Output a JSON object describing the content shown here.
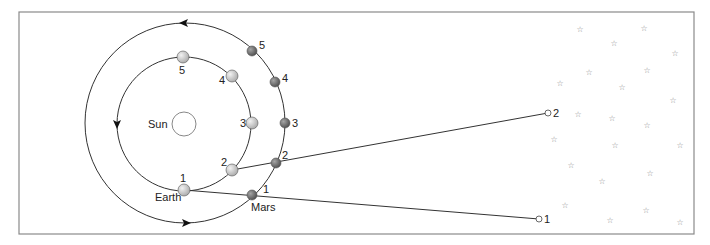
{
  "colors": {
    "frame": "#8a8a8a",
    "line": "#333333",
    "earth_fill": "#c9c9c9",
    "mars_fill": "#6e6e6e",
    "sun_fill": "#ffffff",
    "star": "#8a8a8a"
  },
  "frame": {
    "x": 19,
    "y": 12,
    "w": 675,
    "h": 222
  },
  "sun": {
    "label": "Sun",
    "cx": 184,
    "cy": 124,
    "r": 12,
    "label_x": 148,
    "label_y": 128
  },
  "orbits": {
    "earth": {
      "cx": 184,
      "cy": 124,
      "r": 67
    },
    "mars": {
      "cx": 185,
      "cy": 123,
      "r": 100
    }
  },
  "direction_arrows": [
    {
      "name": "outer-top-arrow",
      "x": 184,
      "y": 23,
      "dir": "left"
    },
    {
      "name": "outer-bottom-arrow",
      "x": 186,
      "y": 223,
      "dir": "right"
    },
    {
      "name": "inner-left-arrow",
      "x": 117,
      "y": 124,
      "dir": "down"
    }
  ],
  "earth_positions": [
    {
      "n": "1",
      "x": 184,
      "y": 190,
      "lx": 180,
      "ly": 182
    },
    {
      "n": "2",
      "x": 232,
      "y": 170,
      "lx": 221,
      "ly": 166
    },
    {
      "n": "3",
      "x": 252,
      "y": 123,
      "lx": 240,
      "ly": 127
    },
    {
      "n": "4",
      "x": 232,
      "y": 76,
      "lx": 219,
      "ly": 84
    },
    {
      "n": "5",
      "x": 183,
      "y": 57,
      "lx": 179,
      "ly": 74
    }
  ],
  "mars_positions": [
    {
      "n": "1",
      "x": 252,
      "y": 195,
      "lx": 263,
      "ly": 193
    },
    {
      "n": "2",
      "x": 276,
      "y": 163,
      "lx": 282,
      "ly": 159
    },
    {
      "n": "3",
      "x": 285,
      "y": 123,
      "lx": 292,
      "ly": 127
    },
    {
      "n": "4",
      "x": 275,
      "y": 82,
      "lx": 282,
      "ly": 82
    },
    {
      "n": "5",
      "x": 252,
      "y": 51,
      "lx": 259,
      "ly": 49
    }
  ],
  "planet_labels": {
    "earth": {
      "text": "Earth",
      "x": 155,
      "y": 201
    },
    "mars": {
      "text": "Mars",
      "x": 251,
      "y": 211
    }
  },
  "sightlines": [
    {
      "n": "1",
      "from": [
        184,
        190
      ],
      "to": [
        539,
        219
      ],
      "end_label_x": 544,
      "end_label_y": 223
    },
    {
      "n": "2",
      "from": [
        232,
        170
      ],
      "to": [
        548,
        113
      ],
      "end_label_x": 553,
      "end_label_y": 117
    }
  ],
  "stars": [
    [
      580,
      29
    ],
    [
      644,
      28
    ],
    [
      614,
      43
    ],
    [
      675,
      53
    ],
    [
      589,
      72
    ],
    [
      647,
      70
    ],
    [
      560,
      83
    ],
    [
      622,
      87
    ],
    [
      673,
      100
    ],
    [
      578,
      114
    ],
    [
      612,
      118
    ],
    [
      647,
      125
    ],
    [
      554,
      139
    ],
    [
      615,
      145
    ],
    [
      680,
      145
    ],
    [
      571,
      165
    ],
    [
      650,
      173
    ],
    [
      602,
      181
    ],
    [
      565,
      205
    ],
    [
      646,
      210
    ],
    [
      610,
      220
    ],
    [
      680,
      222
    ]
  ],
  "star_glyph": "☆"
}
